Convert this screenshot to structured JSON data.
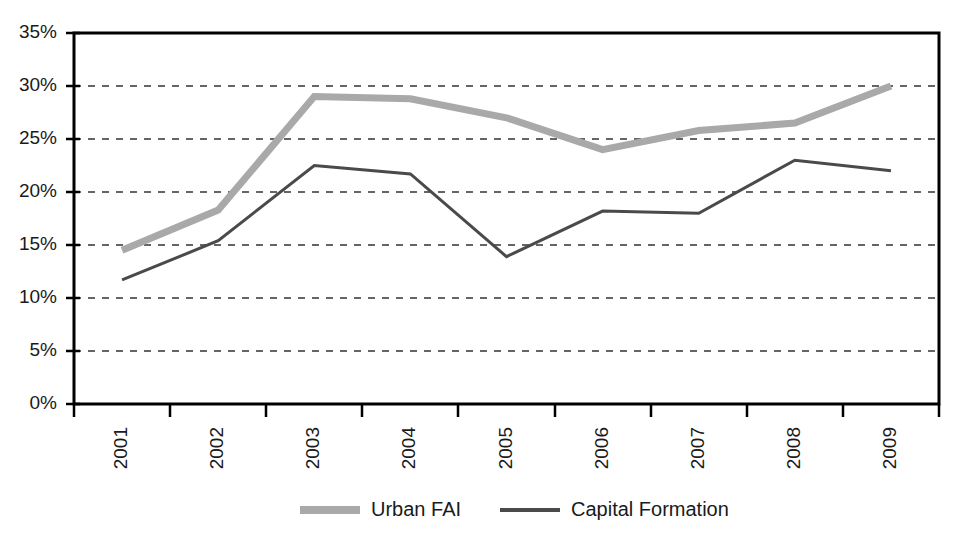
{
  "chart_data": {
    "type": "line",
    "title": "",
    "subtitle": "",
    "xlabel": "",
    "ylabel": "",
    "categories": [
      "2001",
      "2002",
      "2003",
      "2004",
      "2005",
      "2006",
      "2007",
      "2008",
      "2009"
    ],
    "series": [
      {
        "name": "Urban FAI",
        "color": "#a9a9a9",
        "line_width": 7,
        "values": [
          14.5,
          18.3,
          29.0,
          28.8,
          27.0,
          24.0,
          25.8,
          26.5,
          30.0
        ]
      },
      {
        "name": "Capital Formation",
        "color": "#4a4a4a",
        "line_width": 3,
        "values": [
          11.7,
          15.4,
          22.5,
          21.7,
          13.9,
          18.2,
          18.0,
          23.0,
          22.0
        ]
      }
    ],
    "ylim": [
      0,
      35
    ],
    "y_tick_values": [
      0,
      5,
      10,
      15,
      20,
      25,
      30,
      35
    ],
    "y_tick_labels": [
      "0%",
      "5%",
      "10%",
      "15%",
      "20%",
      "25%",
      "30%",
      "35%"
    ],
    "grid": "horizontal-dashed",
    "grid_color": "#333333",
    "axis_color": "#000000",
    "legend_position": "bottom-center",
    "x_tick_label_rotation": -90,
    "value_unit": "percent"
  },
  "legend": {
    "entries": [
      {
        "label": "Urban FAI",
        "swatch": "legend-swatch-urban-fai"
      },
      {
        "label": "Capital Formation",
        "swatch": "legend-swatch-capital-formation"
      }
    ]
  },
  "colors": {
    "background": "#ffffff",
    "text": "#1a1a1a",
    "urban_fai": "#a9a9a9",
    "capital_formation": "#4a4a4a",
    "frame": "#000000",
    "gridline": "#333333"
  }
}
